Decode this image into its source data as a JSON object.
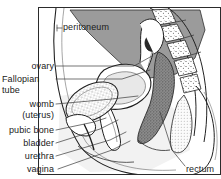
{
  "figure": {
    "type": "anatomical-diagram",
    "frame": {
      "x": 38,
      "y": 7,
      "width": 183,
      "height": 168,
      "stroke": "#2b2b2b"
    },
    "palette": {
      "line": "#1a1a1a",
      "leader": "#4a4a4a",
      "peritoneal_cavity_gray": "#9b9b9b",
      "mid_gray": "#bdbdbd",
      "light_gray": "#e2e2e2",
      "rectum_dark": "#6e6e6e",
      "ovary_dark": "#2a2a2a",
      "background": "#ffffff"
    }
  },
  "labels": [
    {
      "id": "peritoneum",
      "text": "peritoneum",
      "align": "left",
      "x": 63,
      "y": 23,
      "leader": [
        [
          57,
          28
        ],
        [
          62,
          28
        ]
      ],
      "pointer": [
        [
          57,
          28
        ],
        [
          57,
          29
        ]
      ]
    },
    {
      "id": "ovary",
      "text": "ovary",
      "align": "right",
      "x": 2,
      "y": 61,
      "w": 52,
      "leader": [
        [
          56,
          66
        ],
        [
          132,
          66
        ],
        [
          151,
          60
        ]
      ]
    },
    {
      "id": "fallopian-tube",
      "text": "Fallopian\ntube",
      "align": "left",
      "x": 2,
      "y": 74,
      "leader": [
        [
          56,
          79
        ],
        [
          120,
          79
        ],
        [
          150,
          72
        ]
      ]
    },
    {
      "id": "womb-uterus",
      "text": "womb\n(uterus)",
      "align": "right",
      "x": 2,
      "y": 99,
      "w": 52,
      "leader": [
        [
          56,
          104
        ],
        [
          112,
          99
        ],
        [
          139,
          97
        ]
      ]
    },
    {
      "id": "pubic-bone",
      "text": "pubic bone",
      "align": "right",
      "x": 2,
      "y": 125,
      "w": 52,
      "leader": [
        [
          56,
          130
        ],
        [
          95,
          122
        ],
        [
          108,
          118
        ]
      ]
    },
    {
      "id": "bladder",
      "text": "bladder",
      "align": "right",
      "x": 2,
      "y": 138,
      "w": 52,
      "leader": [
        [
          56,
          143
        ],
        [
          100,
          128
        ],
        [
          118,
          122
        ]
      ]
    },
    {
      "id": "urethra",
      "text": "urethra",
      "align": "right",
      "x": 2,
      "y": 151,
      "w": 52,
      "leader": [
        [
          56,
          156
        ],
        [
          110,
          140
        ],
        [
          126,
          134
        ]
      ]
    },
    {
      "id": "vagina",
      "text": "vagina",
      "align": "right",
      "x": 2,
      "y": 164,
      "w": 52,
      "leader": [
        [
          58,
          169
        ],
        [
          112,
          150
        ],
        [
          131,
          142
        ]
      ]
    },
    {
      "id": "rectum",
      "text": "rectum",
      "align": "left",
      "x": 186,
      "y": 165,
      "leader": [
        [
          185,
          166
        ],
        [
          172,
          150
        ],
        [
          160,
          110
        ]
      ]
    }
  ],
  "structures": [
    {
      "id": "abdominal-wall",
      "name": "abdominal wall outline"
    },
    {
      "id": "peritoneal-cavity",
      "name": "peritoneal cavity (shaded)"
    },
    {
      "id": "ovary",
      "name": "ovary"
    },
    {
      "id": "fallopian-tube",
      "name": "Fallopian tube"
    },
    {
      "id": "uterus",
      "name": "womb (uterus)"
    },
    {
      "id": "bladder",
      "name": "bladder (stippled)"
    },
    {
      "id": "pubic-bone",
      "name": "pubic bone"
    },
    {
      "id": "urethra",
      "name": "urethra"
    },
    {
      "id": "vagina",
      "name": "vagina"
    },
    {
      "id": "rectum",
      "name": "rectum"
    },
    {
      "id": "sacrum-vertebrae",
      "name": "sacrum and vertebrae"
    },
    {
      "id": "buttock",
      "name": "buttock outline"
    }
  ]
}
